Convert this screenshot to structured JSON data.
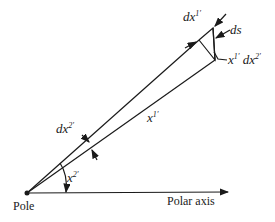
{
  "diagram": {
    "labels": {
      "pole": "Pole",
      "polar_axis": "Polar axis",
      "dx1_base": "dx",
      "dx1_sup": "1′",
      "ds": "ds",
      "x1dx2_a": "x",
      "x1dx2_a_sup": "1′",
      "x1dx2_b": "dx",
      "x1dx2_b_sup": "2′",
      "dx2_base": "dx",
      "dx2_sup": "2′",
      "x1_base": "x",
      "x1_sup": "1′",
      "x2_base": "x",
      "x2_sup": "2′"
    },
    "colors": {
      "line": "#1a1a1a",
      "background": "#ffffff"
    }
  }
}
